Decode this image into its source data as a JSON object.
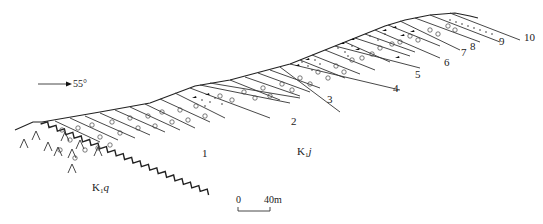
{
  "caption_fragment": "",
  "orientation": {
    "arrow_label": "55°"
  },
  "formations": {
    "upper": {
      "code": "K",
      "sub": "1",
      "italic": "j"
    },
    "lower": {
      "code": "K",
      "sub": "1",
      "italic": "q"
    }
  },
  "layer_labels": [
    "1",
    "2",
    "3",
    "4",
    "5",
    "6",
    "7",
    "8",
    "9",
    "10"
  ],
  "scale_bar": {
    "start": "0",
    "end": "40m"
  },
  "colors": {
    "ink": "#222222",
    "background": "#ffffff"
  }
}
